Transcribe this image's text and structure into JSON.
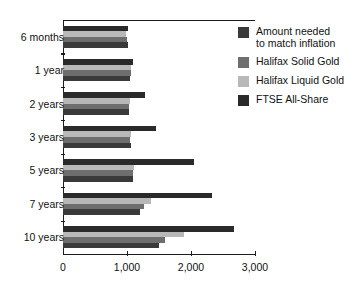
{
  "chart_data": {
    "type": "bar",
    "orientation": "horizontal",
    "title": "",
    "xlabel": "",
    "ylabel": "",
    "categories": [
      "6 months",
      "1 year",
      "2 years",
      "3 years",
      "5 years",
      "7 years",
      "10 years"
    ],
    "series": [
      {
        "name": "Amount needed to match inflation",
        "color": "#3a3a3a",
        "values": [
          1010,
          1040,
          1030,
          1060,
          1100,
          1200,
          1500
        ]
      },
      {
        "name": "Halifax Solid Gold",
        "color": "#6e6e6e",
        "values": [
          1000,
          1060,
          1030,
          1050,
          1090,
          1270,
          1600
        ]
      },
      {
        "name": "Halifax Liquid Gold",
        "color": "#b8b8b8",
        "values": [
          990,
          1070,
          1040,
          1060,
          1110,
          1380,
          1890
        ]
      },
      {
        "name": "FTSE All-Share",
        "color": "#2a2a2a",
        "values": [
          1010,
          1100,
          1280,
          1450,
          2050,
          2330,
          2670
        ]
      }
    ],
    "series_draw_order_top_to_bottom": [
      "FTSE All-Share",
      "Halifax Liquid Gold",
      "Halifax Solid Gold",
      "Amount needed to match inflation"
    ],
    "xlim": [
      0,
      3000
    ],
    "xticks": [
      0,
      1000,
      2000,
      3000
    ],
    "xticklabels": [
      "0",
      "1,000",
      "2,000",
      "3,000"
    ],
    "grid": false,
    "legend_position": "right"
  },
  "legend": {
    "entries": [
      {
        "label": "Amount needed\nto match inflation",
        "color": "#3a3a3a"
      },
      {
        "label": "Halifax Solid Gold",
        "color": "#6e6e6e"
      },
      {
        "label": "Halifax Liquid Gold",
        "color": "#b8b8b8"
      },
      {
        "label": "FTSE All-Share",
        "color": "#2a2a2a"
      }
    ]
  },
  "axis": {
    "tick_labels": [
      "0",
      "1,000",
      "2,000",
      "3,000"
    ]
  },
  "categories": [
    "6 months",
    "1 year",
    "2 years",
    "3 years",
    "5 years",
    "7 years",
    "10 years"
  ],
  "cropped_title": ""
}
